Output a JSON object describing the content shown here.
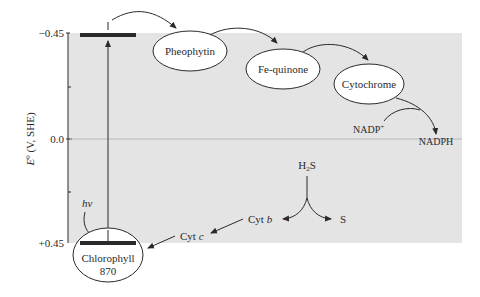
{
  "diagram": {
    "type": "energy-diagram",
    "axis": {
      "label_main": "E",
      "label_sup": "0",
      "label_rest": " (V, SHE)",
      "ticks": [
        {
          "label": "−0.45",
          "value": -0.45
        },
        {
          "label": "0.0",
          "value": 0.0
        },
        {
          "label": "+0.45",
          "value": 0.45
        }
      ]
    },
    "nodes": {
      "chlorophyll": {
        "line1": "Chlorophyll",
        "line2": "870"
      },
      "pheophytin": {
        "label": "Pheophytin"
      },
      "fe_quinone": {
        "label": "Fe-quinone"
      },
      "cytochrome": {
        "label": "Cytochrome"
      }
    },
    "labels": {
      "hv": "hv",
      "nadp": "NADP",
      "nadp_sup": "+",
      "nadph": "NADPH",
      "h2s_h": "H",
      "h2s_sub": "2",
      "h2s_s": "S",
      "sulfur": "S",
      "cyt_b_prefix": "Cyt ",
      "cyt_b_letter": "b",
      "cyt_c_prefix": "Cyt ",
      "cyt_c_letter": "c"
    },
    "colors": {
      "panel": "#e4e4e4",
      "ink": "#2a2a2a",
      "zero_line": "#b8b8b8"
    }
  }
}
